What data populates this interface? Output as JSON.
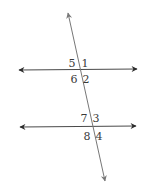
{
  "diagram": {
    "type": "parallel-lines-cut-by-transversal",
    "colors": {
      "line": "#4a4a4a",
      "transversal": "#777777",
      "label": "#3a3a3a",
      "background": "#ffffff"
    },
    "lines": {
      "top_parallel": {
        "x1": 19,
        "y1": 70,
        "x2": 137,
        "y2": 69
      },
      "bottom_parallel": {
        "x1": 20,
        "y1": 127,
        "x2": 136,
        "y2": 126
      },
      "transversal": {
        "x1": 68,
        "y1": 13,
        "x2": 105,
        "y2": 181
      }
    },
    "angle_labels": [
      {
        "id": "5",
        "text": "5",
        "x": 72,
        "y": 63
      },
      {
        "id": "1",
        "text": "1",
        "x": 85,
        "y": 63
      },
      {
        "id": "6",
        "text": "6",
        "x": 74,
        "y": 79
      },
      {
        "id": "2",
        "text": "2",
        "x": 86,
        "y": 79
      },
      {
        "id": "7",
        "text": "7",
        "x": 84,
        "y": 118
      },
      {
        "id": "3",
        "text": "3",
        "x": 96,
        "y": 118
      },
      {
        "id": "8",
        "text": "8",
        "x": 87,
        "y": 136
      },
      {
        "id": "4",
        "text": "4",
        "x": 99,
        "y": 136
      }
    ]
  }
}
